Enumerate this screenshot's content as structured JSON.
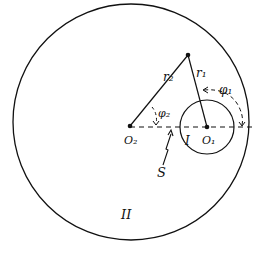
{
  "diagram": {
    "colors": {
      "stroke": "#111111",
      "background": "#ffffff"
    },
    "regions": {
      "inner_label": "I",
      "outer_label": "II"
    },
    "points": {
      "center_small": "O₁",
      "center_large": "O₂"
    },
    "radii": {
      "r1": "r₁",
      "r2": "r₂"
    },
    "angles": {
      "phi1": "φ₁",
      "phi2": "φ₂"
    },
    "source_label": "S"
  }
}
